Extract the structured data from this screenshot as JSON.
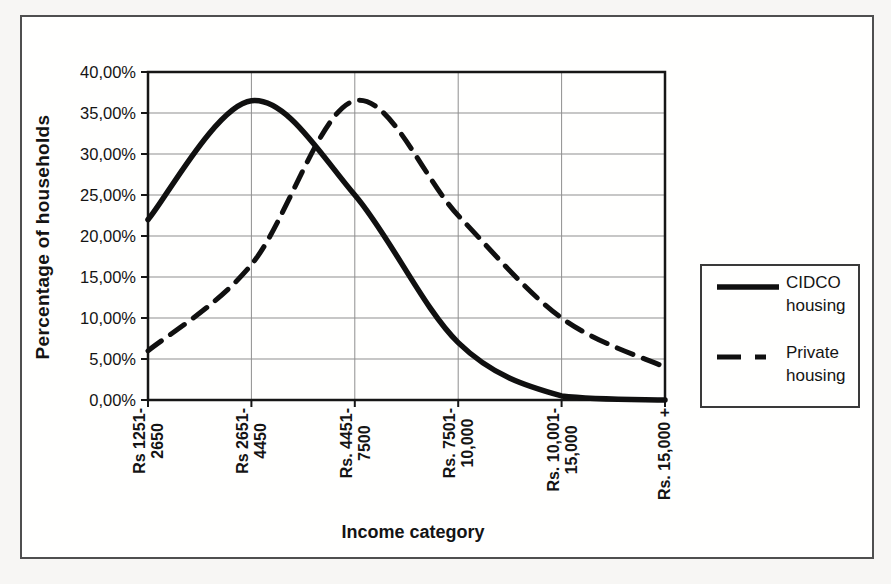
{
  "chart_data": {
    "type": "line",
    "title": "",
    "xlabel": "Income category",
    "ylabel": "Percentage of households",
    "ylim": [
      0,
      40
    ],
    "y_tick_step_percent": 5,
    "y_tick_labels": [
      "40,00%",
      "35,00%",
      "30,00%",
      "25,00%",
      "20,00%",
      "15,00%",
      "10,00%",
      "5,00%",
      "0,00%"
    ],
    "categories": [
      "Rs 1251-2650",
      "Rs 2651-4450",
      "Rs. 4451-7500",
      "Rs. 7501-10,000",
      "Rs. 10,001-15,000",
      "Rs. 15,000 +"
    ],
    "category_label_lines": [
      [
        "Rs 1251-",
        "2650"
      ],
      [
        "Rs 2651-",
        "4450"
      ],
      [
        "Rs. 4451-",
        "7500"
      ],
      [
        "Rs. 7501-",
        "10,000"
      ],
      [
        "Rs. 10,001-",
        "15,000"
      ],
      [
        "Rs. 15,000 +",
        ""
      ]
    ],
    "x_tick_label_rotation_deg": 90,
    "grid": true,
    "legend_position": "right",
    "line_color": "#101010",
    "series": [
      {
        "name": "CIDCO housing",
        "name_lines": [
          "CIDCO",
          "housing"
        ],
        "line_style": "solid",
        "values_percent": [
          22,
          36.5,
          25,
          7,
          0.5,
          0
        ]
      },
      {
        "name": "Private housing",
        "name_lines": [
          "Private",
          "housing"
        ],
        "line_style": "dashed",
        "values_percent": [
          6,
          16.5,
          36.5,
          22.5,
          10,
          4
        ]
      }
    ]
  }
}
